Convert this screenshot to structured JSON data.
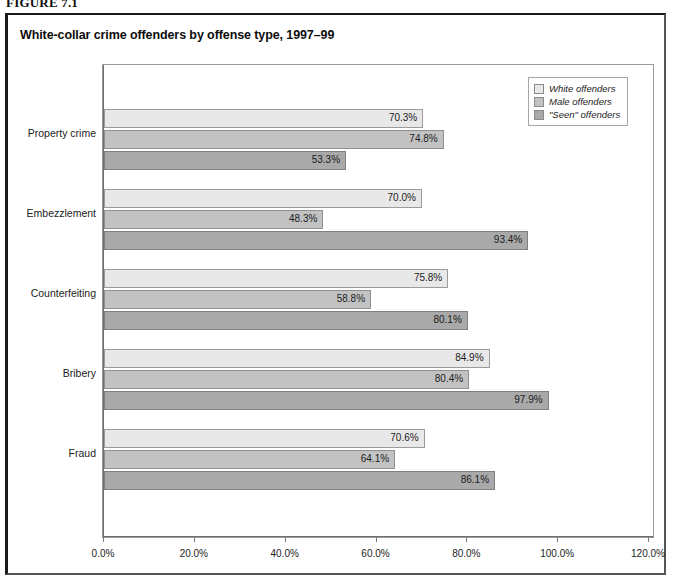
{
  "figure": {
    "label": "FIGURE 7.1",
    "title": "White-collar crime offenders by offense type, 1997–99"
  },
  "legend": {
    "position": "top-right",
    "items": [
      {
        "label": "White offenders",
        "color": "#e8e8e8"
      },
      {
        "label": "Male offenders",
        "color": "#c2c2c2"
      },
      {
        "label": "\"Seen\" offenders",
        "color": "#a9a9a9"
      }
    ]
  },
  "axis": {
    "x_ticks": [
      "0.0%",
      "20.0%",
      "40.0%",
      "60.0%",
      "80.0%",
      "100.0%",
      "120.0%"
    ],
    "y_categories": [
      "Property crime",
      "Embezzlement",
      "Counterfeiting",
      "Bribery",
      "Fraud"
    ]
  },
  "chart_data": {
    "type": "bar",
    "orientation": "horizontal",
    "title": "White-collar crime offenders by offense type, 1997–99",
    "xlabel": "",
    "ylabel": "",
    "xlim": [
      0,
      120
    ],
    "xtick_values": [
      0,
      20,
      40,
      60,
      80,
      100,
      120
    ],
    "xtick_labels": [
      "0.0%",
      "20.0%",
      "40.0%",
      "60.0%",
      "80.0%",
      "100.0%",
      "120.0%"
    ],
    "grid": false,
    "legend_position": "upper right",
    "categories": [
      "Property crime",
      "Embezzlement",
      "Counterfeiting",
      "Bribery",
      "Fraud"
    ],
    "series": [
      {
        "name": "White offenders",
        "color": "#e8e8e8",
        "values": [
          70.3,
          70.0,
          75.8,
          84.9,
          70.6
        ],
        "labels": [
          "70.3%",
          "70.0%",
          "75.8%",
          "84.9%",
          "70.6%"
        ]
      },
      {
        "name": "Male offenders",
        "color": "#c2c2c2",
        "values": [
          74.8,
          48.3,
          58.8,
          80.4,
          64.1
        ],
        "labels": [
          "74.8%",
          "48.3%",
          "58.8%",
          "80.4%",
          "64.1%"
        ]
      },
      {
        "name": "\"Seen\" offenders",
        "color": "#a9a9a9",
        "values": [
          53.3,
          93.4,
          80.1,
          97.9,
          86.1
        ],
        "labels": [
          "53.3%",
          "93.4%",
          "80.1%",
          "97.9%",
          "86.1%"
        ]
      }
    ]
  }
}
